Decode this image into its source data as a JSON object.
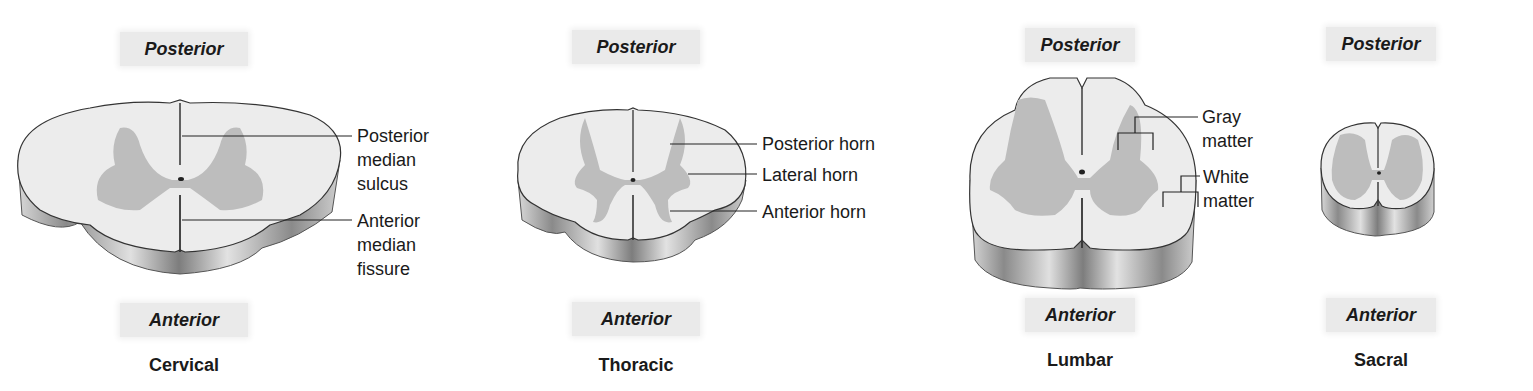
{
  "sections": [
    {
      "name": "Cervical",
      "posterior_label": "Posterior",
      "anterior_label": "Anterior",
      "callouts": [
        {
          "label": "Posterior median sulcus",
          "lines": [
            "Posterior",
            "median",
            "sulcus"
          ]
        },
        {
          "label": "Anterior median fissure",
          "lines": [
            "Anterior",
            "median",
            "fissure"
          ]
        }
      ]
    },
    {
      "name": "Thoracic",
      "posterior_label": "Posterior",
      "anterior_label": "Anterior",
      "callouts": [
        {
          "label": "Posterior horn",
          "lines": [
            "Posterior horn"
          ]
        },
        {
          "label": "Lateral horn",
          "lines": [
            "Lateral horn"
          ]
        },
        {
          "label": "Anterior horn",
          "lines": [
            "Anterior horn"
          ]
        }
      ]
    },
    {
      "name": "Lumbar",
      "posterior_label": "Posterior",
      "anterior_label": "Anterior",
      "callouts": [
        {
          "label": "Gray matter",
          "lines": [
            "Gray",
            "matter"
          ]
        },
        {
          "label": "White matter",
          "lines": [
            "White",
            "matter"
          ]
        }
      ]
    },
    {
      "name": "Sacral",
      "posterior_label": "Posterior",
      "anterior_label": "Anterior",
      "callouts": []
    }
  ],
  "colors": {
    "white_matter": "#ececec",
    "gray_matter": "#bdbdbd",
    "side_wall": "#9a9a9a",
    "label_bg": "#eaeaea"
  }
}
